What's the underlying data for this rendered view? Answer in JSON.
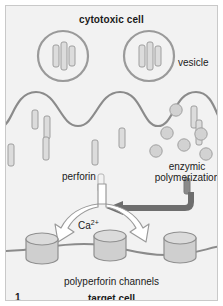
{
  "figure": {
    "number": "1",
    "title": "cytotoxic cell",
    "target_label": "target cell",
    "channels_label": "polyperforin channels",
    "vesicle_label": "vesicle",
    "perforin_label": "perforin",
    "enzymic_label_line1": "enzymic",
    "enzymic_label_line2": "polymerization",
    "calcium_label_base": "Ca",
    "calcium_label_sup": "2+"
  },
  "colors": {
    "background": "#f2f2f2",
    "frame_border": "#c9c9c9",
    "page_background": "#ffffff",
    "membrane_stroke": "#8b8b8b",
    "vesicle_stroke": "#9a9a9a",
    "perforin_fill": "#dcdcdc",
    "perforin_stroke": "#9e9e9e",
    "polymer_fill": "#d2d2d2",
    "polymer_stroke": "#a0a0a0",
    "channel_fill": "#cfcfcf",
    "channel_stroke": "#8f8f8f",
    "arrow_dark": "#6e6e6e",
    "arrow_white_fill": "#ffffff",
    "arrow_white_stroke": "#9a9a9a",
    "text": "#1a1a1a"
  },
  "elements": {
    "vesicles": [
      {
        "cx": 62,
        "cy": 55,
        "r": 24
      },
      {
        "cx": 148,
        "cy": 55,
        "r": 24
      }
    ],
    "vesicle_perforin_bars": [
      {
        "x": 52,
        "y": 44,
        "w": 6,
        "h": 22
      },
      {
        "x": 60,
        "y": 42,
        "w": 6,
        "h": 26
      },
      {
        "x": 68,
        "y": 45,
        "w": 6,
        "h": 20
      },
      {
        "x": 138,
        "y": 44,
        "w": 6,
        "h": 22
      },
      {
        "x": 146,
        "y": 42,
        "w": 6,
        "h": 26
      },
      {
        "x": 154,
        "y": 45,
        "w": 6,
        "h": 20
      }
    ],
    "free_perforin_bars": [
      {
        "x": 30,
        "y": 108,
        "w": 6,
        "h": 18,
        "rot": 0
      },
      {
        "x": 42,
        "y": 113,
        "w": 6,
        "h": 22,
        "rot": 0
      },
      {
        "x": 41,
        "y": 133,
        "w": 6,
        "h": 22,
        "rot": 0
      },
      {
        "x": 90,
        "y": 137,
        "w": 6,
        "h": 24,
        "rot": 0
      },
      {
        "x": 117,
        "y": 125,
        "w": 6,
        "h": 20,
        "rot": 0
      },
      {
        "x": 190,
        "y": 106,
        "w": 6,
        "h": 22,
        "rot": 0
      },
      {
        "x": 196,
        "y": 118,
        "w": 6,
        "h": 24,
        "rot": 0
      },
      {
        "x": 6,
        "y": 140,
        "w": 6,
        "h": 22,
        "rot": 0
      }
    ],
    "polymer_dots": [
      {
        "cx": 175,
        "cy": 108,
        "r": 6
      },
      {
        "cx": 166,
        "cy": 131,
        "r": 6
      },
      {
        "cx": 182,
        "cy": 143,
        "r": 6
      },
      {
        "cx": 199,
        "cy": 133,
        "r": 6
      },
      {
        "cx": 155,
        "cy": 148,
        "r": 6
      },
      {
        "cx": 204,
        "cy": 152,
        "r": 6
      }
    ],
    "channels": [
      {
        "cx": 40,
        "cy": 243
      },
      {
        "cx": 108,
        "cy": 240
      },
      {
        "cx": 178,
        "cy": 242
      }
    ]
  }
}
